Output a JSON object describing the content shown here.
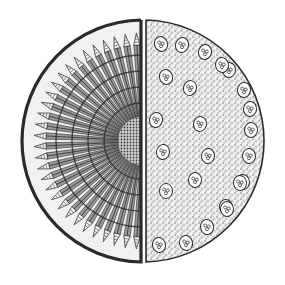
{
  "figure": {
    "left_half": {
      "label": "dicot-stem-section",
      "description": "Radially arranged vascular bundles in rings around a dense central pith",
      "bundle_count": 30,
      "ring_count": 4
    },
    "right_half": {
      "label": "monocot-stem-section",
      "description": "Scattered vascular bundles in ground tissue",
      "bundle_count": 24
    },
    "colors": {
      "ink": "#2a2a2a",
      "paper": "#ffffff",
      "stipple": "#8a8a8a",
      "light_fill": "#ececec"
    }
  }
}
